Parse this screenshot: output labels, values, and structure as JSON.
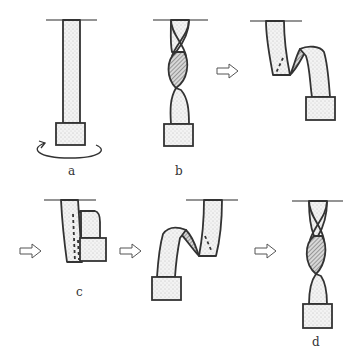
{
  "diagram": {
    "colors": {
      "background": "#ffffff",
      "stroke": "#333333",
      "fill_dots": "#f2f2f2",
      "hatch": "#555555",
      "arrow_stroke": "#555555"
    },
    "panels": [
      {
        "id": "a",
        "label": "a",
        "state": "untwisted strip with rotation arrow"
      },
      {
        "id": "b",
        "label": "b",
        "state": "twisted strip"
      },
      {
        "id": "b2",
        "label": "",
        "state": "strip folding over"
      },
      {
        "id": "c",
        "label": "c",
        "state": "folded strip"
      },
      {
        "id": "c2",
        "label": "",
        "state": "strip unfolding other side"
      },
      {
        "id": "d",
        "label": "d",
        "state": "twisted strip, opposite handedness"
      }
    ],
    "arrows": [
      {
        "from": "b",
        "to": "b2",
        "glyph": "⇨"
      },
      {
        "from": "b2",
        "to": "c",
        "glyph": "⇨"
      },
      {
        "from": "c",
        "to": "c2",
        "glyph": "⇨"
      },
      {
        "from": "c2",
        "to": "d",
        "glyph": "⇨"
      }
    ]
  }
}
